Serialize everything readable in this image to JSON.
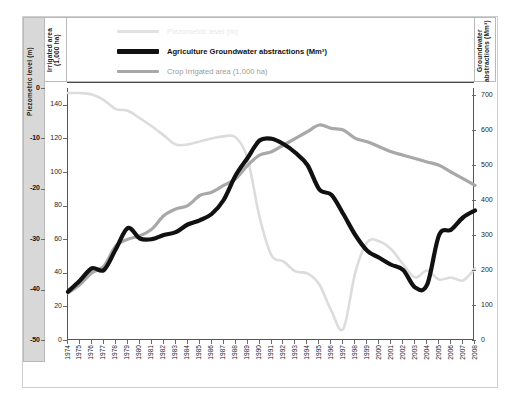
{
  "figure": {
    "left_axis_title": "Piezometric level (m)",
    "second_axis_title": "Irrigated area (1,000 ha)",
    "right_axis_title": "Groundwater abstractions (Mm³)"
  },
  "legend": {
    "position": "top-inside",
    "items": [
      {
        "label": "Piezometric level (m)",
        "color": "#dcdcdc",
        "width": 2.5,
        "faded": true
      },
      {
        "label": "Agriculture Groundwater abstractions (Mm³)",
        "color": "#111111",
        "width": 4.2,
        "faded": false
      },
      {
        "label": "Crop Irrigated area (1,000 ha)",
        "color": "#a8a8a8",
        "width": 3.2,
        "faded": true
      }
    ]
  },
  "chart_data": {
    "type": "line",
    "title": "",
    "subtitle": "",
    "xlabel": "",
    "grid": false,
    "x": [
      1974,
      1975,
      1976,
      1977,
      1978,
      1979,
      1980,
      1981,
      1982,
      1983,
      1984,
      1985,
      1986,
      1987,
      1988,
      1989,
      1990,
      1991,
      1992,
      1993,
      1994,
      1995,
      1996,
      1997,
      1998,
      1999,
      2000,
      2001,
      2002,
      2003,
      2004,
      2005,
      2006,
      2007,
      2008
    ],
    "xlim": [
      1974,
      2008
    ],
    "xtick_labels": [
      "1974",
      "1975",
      "1976",
      "1977",
      "1978",
      "1979",
      "1980",
      "1981",
      "1982",
      "1983",
      "1984",
      "1985",
      "1986",
      "1987",
      "1988",
      "1989",
      "1990",
      "1991",
      "1992",
      "1993",
      "1994",
      "1995",
      "1996",
      "1997",
      "1998",
      "1999",
      "2000",
      "2001",
      "2002",
      "2003",
      "2004",
      "2005",
      "2006",
      "2007",
      "2008"
    ],
    "axes": [
      {
        "id": "piezometric",
        "side": "left-outer",
        "label": "Piezometric level (m)",
        "ylim": [
          -50,
          0
        ],
        "ytick_labels": [
          "0",
          "-10",
          "-20",
          "-30",
          "-40",
          "-50"
        ],
        "yticks": [
          0,
          -10,
          -20,
          -30,
          -40,
          -50
        ]
      },
      {
        "id": "irrigated_area",
        "side": "left-inner",
        "label": "Irrigated area (1,000 ha)",
        "ylim": [
          0,
          150
        ],
        "ytick_labels": [
          "0",
          "20",
          "40",
          "60",
          "80",
          "100",
          "120",
          "140"
        ],
        "yticks": [
          0,
          20,
          40,
          60,
          80,
          100,
          120,
          140
        ]
      },
      {
        "id": "groundwater_abstractions",
        "side": "right",
        "label": "Groundwater abstractions (Mm³)",
        "ylim": [
          0,
          720
        ],
        "ytick_labels": [
          "0",
          "100",
          "200",
          "300",
          "400",
          "500",
          "600",
          "700"
        ],
        "yticks": [
          0,
          100,
          200,
          300,
          400,
          500,
          600,
          700
        ]
      }
    ],
    "series": [
      {
        "name": "Piezometric level (m)",
        "axis": "piezometric",
        "unit": "m",
        "color": "#dcdcdc",
        "width": 2.6,
        "values": [
          -1.0,
          -1.0,
          -1.3,
          -2.4,
          -4.2,
          -4.5,
          -6.0,
          -7.6,
          -9.4,
          -11.2,
          -11.2,
          -10.6,
          -10.0,
          -9.6,
          -9.8,
          -14.0,
          -25.6,
          -33.2,
          -34.4,
          -36.4,
          -36.8,
          -39.0,
          -44.2,
          -47.8,
          -36.6,
          -30.6,
          -30.4,
          -32.0,
          -35.0,
          -37.6,
          -36.2,
          -38.0,
          -37.6,
          -38.2,
          -35.8
        ]
      },
      {
        "name": "Agriculture Groundwater abstractions (Mm³)",
        "axis": "groundwater_abstractions",
        "unit": "Mm³",
        "color": "#111111",
        "width": 4.2,
        "values": [
          138,
          170,
          205,
          200,
          260,
          320,
          290,
          288,
          300,
          308,
          330,
          342,
          360,
          400,
          470,
          520,
          570,
          575,
          560,
          535,
          500,
          430,
          415,
          360,
          300,
          255,
          235,
          215,
          200,
          150,
          158,
          300,
          315,
          350,
          370
        ]
      },
      {
        "name": "Crop Irrigated area (1,000 ha)",
        "axis": "irrigated_area",
        "unit": "1,000 ha",
        "color": "#a8a8a8",
        "width": 3.2,
        "values": [
          28,
          33,
          40,
          44,
          56,
          60,
          62,
          66,
          74,
          78,
          80,
          86,
          88,
          92,
          96,
          104,
          110,
          112,
          116,
          120,
          124,
          128,
          126,
          125,
          120,
          118,
          115,
          112,
          110,
          108,
          106,
          104,
          100,
          96,
          92
        ]
      }
    ],
    "annotations": []
  }
}
